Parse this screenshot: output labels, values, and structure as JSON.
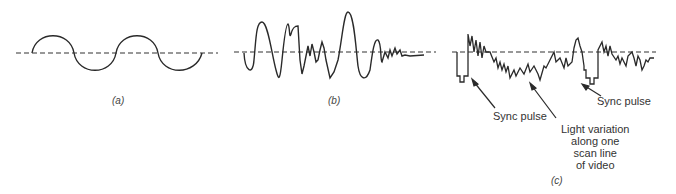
{
  "figure": {
    "panels": [
      {
        "id": "a",
        "caption": "(a)",
        "description": "Sine wave"
      },
      {
        "id": "b",
        "caption": "(b)",
        "description": "Audio waveform"
      },
      {
        "id": "c",
        "caption": "(c)",
        "description": "Video signal"
      }
    ],
    "annotations": {
      "sync_pulse_left": "Sync pulse",
      "sync_pulse_right": "Sync pulse",
      "light_variation": [
        "Light variation",
        "along one",
        "scan line",
        "of video"
      ]
    },
    "colors": {
      "stroke": "#2a2a2a",
      "text": "#333333"
    }
  }
}
